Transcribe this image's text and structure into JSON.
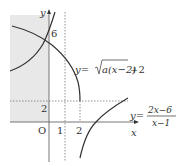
{
  "figure": {
    "axes": {
      "x_label": "x",
      "y_label": "y",
      "origin_label": "O"
    },
    "ticks": {
      "x": [
        "1",
        "2"
      ],
      "y": [
        "2",
        "6"
      ]
    },
    "curves": [
      {
        "name": "radical-function",
        "label": "y=√a(x−2)+2",
        "label_parts": {
          "lhs": "y=",
          "radicand": "a(x−2)",
          "tail": "+2"
        },
        "description": "decreasing curve ending at (2, 2)"
      },
      {
        "name": "rational-function",
        "label": "y=(2x−6)/(x−1)",
        "label_parts": {
          "lhs": "y=",
          "numerator": "2x−6",
          "denominator": "x−1"
        },
        "description": "hyperbola with asymptotes x=1 and y=2, passing through (0, 6) and (3, 0)"
      }
    ],
    "asymptotes": {
      "vertical": "x=1",
      "horizontal": "y=2"
    },
    "shaded_region": "x ≤ 0 region, grey",
    "colors": {
      "curve": "#333333",
      "axis": "#555555",
      "dashed": "#777777",
      "shade": "#e6e6e6"
    }
  }
}
